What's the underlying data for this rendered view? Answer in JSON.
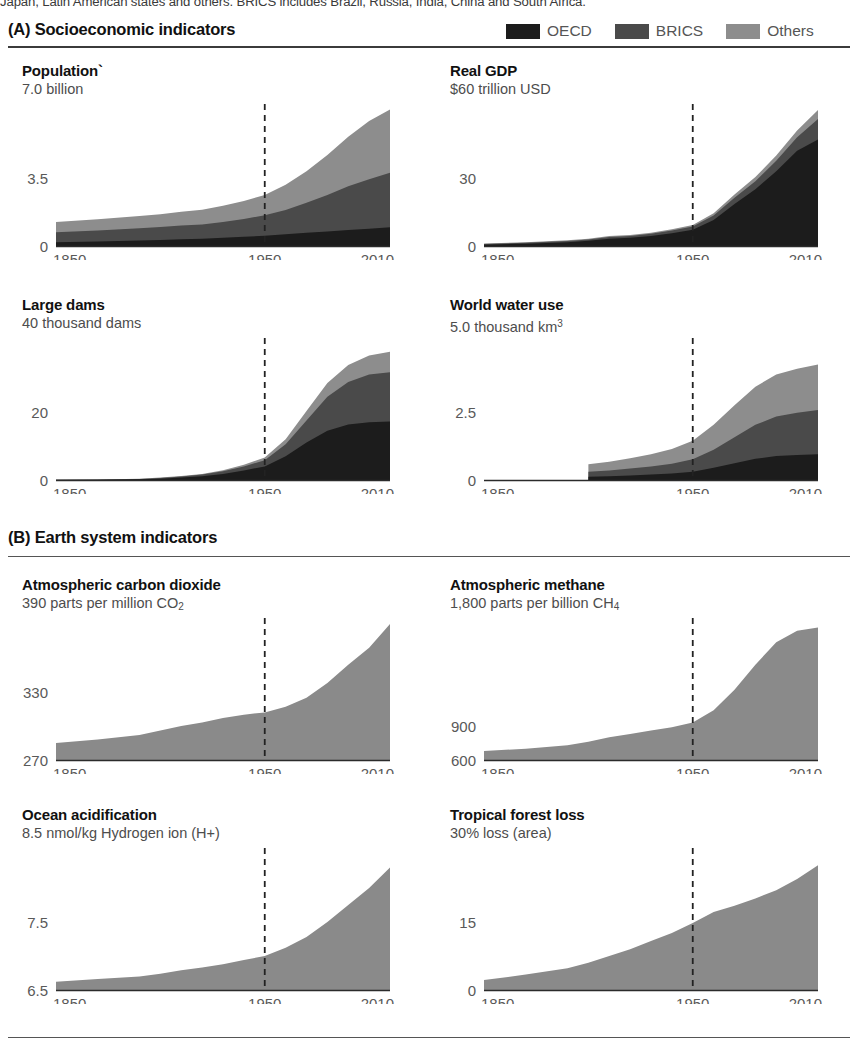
{
  "caption_top": "Japan, Latin American states and others. BRICS includes Brazil, Russia, India, China and South Africa.",
  "colors": {
    "oecd": "#1c1c1c",
    "brics": "#4a4a4a",
    "others": "#8d8d8d",
    "single": "#8a8a8a",
    "axis": "#2b2b2b",
    "dash": "#222222",
    "tick_text": "#595959",
    "rule": "#3b3b3b"
  },
  "sections": [
    {
      "id": "A",
      "label": "(A) Socioeconomic indicators"
    },
    {
      "id": "B",
      "label": "(B) Earth system indicators"
    }
  ],
  "legend": {
    "items": [
      {
        "key": "oecd",
        "label": "OECD",
        "color": "#1c1c1c"
      },
      {
        "key": "brics",
        "label": "BRICS",
        "color": "#4a4a4a"
      },
      {
        "key": "others",
        "label": "Others",
        "color": "#8d8d8d"
      }
    ]
  },
  "axis_common": {
    "x_ticks": [
      "1850",
      "1950",
      "2010"
    ],
    "x_tick_years": [
      1850,
      1950,
      2010
    ],
    "marker_year": 1950,
    "x_min": 1850,
    "x_max": 2010
  },
  "chart_data": [
    {
      "id": "population",
      "type": "area",
      "stacked": true,
      "title": "Population`",
      "subtitle": "7.0 billion",
      "unit": "billion",
      "ylabel": "",
      "xlabel": "",
      "ylim": [
        0,
        7.0
      ],
      "y_ticks": [
        0,
        3.5,
        7.0
      ],
      "y_tick_labels": [
        "0",
        "3.5",
        "7.0 billion"
      ],
      "y_axis_labels_shown": [
        "0",
        "3.5"
      ],
      "grid": false,
      "legend_position": "figure-top-right",
      "marker_year": 1950,
      "x": [
        1850,
        1870,
        1890,
        1900,
        1910,
        1920,
        1930,
        1940,
        1950,
        1960,
        1970,
        1980,
        1990,
        2000,
        2010
      ],
      "series": [
        {
          "name": "OECD",
          "values": [
            0.19,
            0.23,
            0.28,
            0.31,
            0.35,
            0.37,
            0.42,
            0.47,
            0.53,
            0.6,
            0.68,
            0.75,
            0.82,
            0.89,
            0.97
          ]
        },
        {
          "name": "BRICS",
          "values": [
            0.52,
            0.57,
            0.63,
            0.67,
            0.71,
            0.74,
            0.82,
            0.92,
            1.05,
            1.25,
            1.55,
            1.88,
            2.25,
            2.55,
            2.8
          ]
        },
        {
          "name": "Others",
          "values": [
            0.53,
            0.58,
            0.63,
            0.66,
            0.7,
            0.75,
            0.83,
            0.92,
            1.05,
            1.3,
            1.62,
            2.05,
            2.55,
            3.0,
            3.25
          ]
        }
      ]
    },
    {
      "id": "real-gdp",
      "type": "area",
      "stacked": true,
      "title": "Real GDP",
      "subtitle": "$60 trillion USD",
      "unit": "trillion USD",
      "ylim": [
        0,
        60
      ],
      "y_ticks": [
        0,
        30,
        60
      ],
      "y_tick_labels": [
        "0",
        "30",
        "$60 trillion USD"
      ],
      "y_axis_labels_shown": [
        "0",
        "30"
      ],
      "grid": false,
      "marker_year": 1950,
      "x": [
        1850,
        1870,
        1890,
        1900,
        1910,
        1920,
        1930,
        1940,
        1950,
        1960,
        1970,
        1980,
        1990,
        2000,
        2010
      ],
      "series": [
        {
          "name": "OECD",
          "values": [
            0.6,
            1.0,
            1.7,
            2.3,
            3.2,
            3.6,
            4.4,
            5.6,
            7.2,
            11.5,
            18.5,
            25.0,
            33.0,
            42.0,
            47.0
          ]
        },
        {
          "name": "BRICS",
          "values": [
            0.3,
            0.4,
            0.5,
            0.6,
            0.8,
            0.8,
            1.0,
            1.2,
            1.4,
            2.0,
            2.8,
            3.6,
            4.6,
            6.0,
            9.0
          ]
        },
        {
          "name": "Others",
          "values": [
            0.2,
            0.2,
            0.3,
            0.3,
            0.4,
            0.4,
            0.5,
            0.6,
            0.7,
            1.0,
            1.4,
            1.8,
            2.3,
            3.0,
            4.0
          ]
        }
      ]
    },
    {
      "id": "large-dams",
      "type": "area",
      "stacked": true,
      "title": "Large dams",
      "subtitle": "40 thousand dams",
      "unit": "thousand dams",
      "ylim": [
        0,
        40
      ],
      "y_ticks": [
        0,
        20,
        40
      ],
      "y_tick_labels": [
        "0",
        "20",
        "40 thousand dams"
      ],
      "y_axis_labels_shown": [
        "0",
        "20"
      ],
      "grid": false,
      "marker_year": 1950,
      "x": [
        1850,
        1870,
        1890,
        1900,
        1910,
        1920,
        1930,
        1940,
        1950,
        1960,
        1970,
        1980,
        1990,
        2000,
        2010
      ],
      "series": [
        {
          "name": "OECD",
          "values": [
            0.05,
            0.1,
            0.2,
            0.4,
            0.7,
            1.1,
            1.8,
            2.8,
            4.0,
            7.0,
            11.0,
            14.5,
            16.3,
            17.0,
            17.2
          ]
        },
        {
          "name": "BRICS",
          "values": [
            0.02,
            0.05,
            0.1,
            0.2,
            0.3,
            0.5,
            0.8,
            1.2,
            1.8,
            3.5,
            6.5,
            10.0,
            12.5,
            14.0,
            14.5
          ]
        },
        {
          "name": "Others",
          "values": [
            0.01,
            0.02,
            0.05,
            0.1,
            0.15,
            0.2,
            0.3,
            0.5,
            0.8,
            1.5,
            2.8,
            4.0,
            5.0,
            5.6,
            6.0
          ]
        }
      ]
    },
    {
      "id": "world-water-use",
      "type": "area",
      "stacked": true,
      "title": "World water use",
      "subtitle": "5.0 thousand km³",
      "unit": "thousand km3",
      "ylim": [
        0,
        5.0
      ],
      "y_ticks": [
        0,
        2.5,
        5.0
      ],
      "y_tick_labels": [
        "0",
        "2.5",
        "5.0 thousand km³"
      ],
      "y_axis_labels_shown": [
        "0",
        "2.5"
      ],
      "grid": false,
      "marker_year": 1950,
      "data_start_year": 1900,
      "x": [
        1900,
        1910,
        1920,
        1930,
        1940,
        1950,
        1960,
        1970,
        1980,
        1990,
        2000,
        2010
      ],
      "series": [
        {
          "name": "OECD",
          "values": [
            0.12,
            0.14,
            0.17,
            0.2,
            0.24,
            0.3,
            0.45,
            0.62,
            0.78,
            0.88,
            0.92,
            0.95
          ]
        },
        {
          "name": "BRICS",
          "values": [
            0.18,
            0.21,
            0.25,
            0.3,
            0.36,
            0.46,
            0.66,
            0.95,
            1.25,
            1.45,
            1.55,
            1.62
          ]
        },
        {
          "name": "Others",
          "values": [
            0.28,
            0.32,
            0.38,
            0.45,
            0.54,
            0.68,
            0.92,
            1.18,
            1.4,
            1.55,
            1.62,
            1.68
          ]
        }
      ]
    },
    {
      "id": "atmospheric-co2",
      "type": "area",
      "stacked": false,
      "title": "Atmospheric carbon dioxide",
      "subtitle": "390 parts per million CO₂",
      "subtitle_main": "390 parts per million CO",
      "subtitle_sub": "2",
      "unit": "ppm CO2",
      "ylim": [
        270,
        390
      ],
      "y_ticks": [
        270,
        330,
        390
      ],
      "y_tick_labels": [
        "270",
        "330",
        "390 parts per million CO2"
      ],
      "y_axis_labels_shown": [
        "270",
        "330"
      ],
      "grid": false,
      "marker_year": 1950,
      "x": [
        1850,
        1870,
        1890,
        1900,
        1910,
        1920,
        1930,
        1940,
        1950,
        1960,
        1970,
        1980,
        1990,
        2000,
        2010
      ],
      "values": [
        285,
        288,
        292,
        296,
        300,
        303,
        307,
        310,
        312,
        317,
        325,
        338,
        354,
        369,
        390
      ]
    },
    {
      "id": "atmospheric-methane",
      "type": "area",
      "stacked": false,
      "title": "Atmospheric methane",
      "subtitle": "1,800 parts per billion CH₄",
      "subtitle_main": "1,800 parts per billion CH",
      "subtitle_sub": "4",
      "unit": "ppb CH4",
      "ylim": [
        600,
        1800
      ],
      "y_ticks": [
        600,
        900,
        1800
      ],
      "y_tick_labels": [
        "600",
        "900",
        "1,800 parts per billion CH4"
      ],
      "y_axis_labels_shown": [
        "600",
        "900"
      ],
      "grid": false,
      "marker_year": 1950,
      "x": [
        1850,
        1870,
        1890,
        1900,
        1910,
        1920,
        1930,
        1940,
        1950,
        1960,
        1970,
        1980,
        1990,
        2000,
        2010
      ],
      "values": [
        680,
        700,
        730,
        760,
        800,
        830,
        860,
        890,
        930,
        1040,
        1220,
        1440,
        1640,
        1740,
        1770
      ]
    },
    {
      "id": "ocean-acidification",
      "type": "area",
      "stacked": false,
      "title": "Ocean acidification",
      "subtitle": "8.5 nmol/kg Hydrogen ion (H+)",
      "unit": "nmol/kg H+",
      "ylim": [
        6.5,
        8.5
      ],
      "y_ticks": [
        6.5,
        7.5,
        8.5
      ],
      "y_tick_labels": [
        "6.5",
        "7.5",
        "8.5 nmol/kg Hydrogen ion (H+)"
      ],
      "y_axis_labels_shown": [
        "6.5",
        "7.5"
      ],
      "grid": false,
      "marker_year": 1950,
      "x": [
        1850,
        1870,
        1890,
        1900,
        1910,
        1920,
        1930,
        1940,
        1950,
        1960,
        1970,
        1980,
        1990,
        2000,
        2010
      ],
      "values": [
        6.62,
        6.66,
        6.7,
        6.74,
        6.79,
        6.83,
        6.88,
        6.94,
        7.0,
        7.12,
        7.28,
        7.5,
        7.75,
        8.0,
        8.3
      ]
    },
    {
      "id": "tropical-forest-loss",
      "type": "area",
      "stacked": false,
      "title": "Tropical forest loss",
      "subtitle": "30% loss (area)",
      "unit": "% loss (area)",
      "ylim": [
        0,
        30
      ],
      "y_ticks": [
        0,
        15,
        30
      ],
      "y_tick_labels": [
        "0",
        "15",
        "30% loss (area)"
      ],
      "y_axis_labels_shown": [
        "0",
        "15"
      ],
      "grid": false,
      "marker_year": 1950,
      "x": [
        1850,
        1870,
        1890,
        1900,
        1910,
        1920,
        1930,
        1940,
        1950,
        1960,
        1970,
        1980,
        1990,
        2000,
        2010
      ],
      "values": [
        2.2,
        3.4,
        4.8,
        6.0,
        7.5,
        9.0,
        10.8,
        12.6,
        14.8,
        17.2,
        18.6,
        20.2,
        22.0,
        24.5,
        27.5
      ]
    }
  ]
}
